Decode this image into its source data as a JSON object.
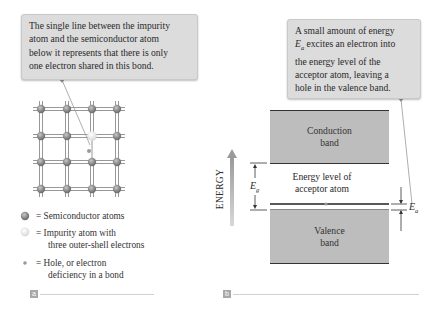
{
  "panel_a": {
    "label": "a",
    "callout": {
      "lines": [
        "The single line between the impurity",
        "atom and the semiconductor atom",
        "below it represents that there is only",
        "one electron shared in this bond."
      ]
    },
    "lattice": {
      "rows": 4,
      "cols": 4,
      "impurity_position": {
        "row": 2,
        "col": 3
      },
      "hole": "below impurity atom"
    },
    "legend": [
      {
        "icon": "semiconductor-atom-icon",
        "text_lines": [
          "= Semiconductor atoms"
        ]
      },
      {
        "icon": "impurity-atom-icon",
        "text_lines": [
          "= Impurity atom with",
          "three outer-shell electrons"
        ]
      },
      {
        "icon": "hole-icon",
        "text_lines": [
          "= Hole, or electron",
          "deficiency in a bond"
        ]
      }
    ]
  },
  "panel_b": {
    "label": "b",
    "callout": {
      "line1": "A small amount of energy",
      "line2_symbol": "E",
      "line2_sub": "a",
      "line2_rest": " excites an electron into",
      "line3": "the energy level of the",
      "line4": "acceptor atom, leaving a",
      "line5": "hole in the valence band."
    },
    "axis_label": "ENERGY",
    "conduction_band": {
      "line1": "Conduction",
      "line2": "band"
    },
    "acceptor_level": {
      "line1": "Energy level of",
      "line2": "acceptor atom"
    },
    "valence_band": {
      "line1": "Valence",
      "line2": "band"
    },
    "gap_label": {
      "symbol": "E",
      "sub": "g"
    },
    "acceptor_gap_label": {
      "symbol": "E",
      "sub": "a"
    }
  },
  "colors": {
    "callout_bg": "#dcdcdc",
    "band_fill": "#bdbdbd",
    "atom": "#8a8a8a",
    "impurity": "#ececec",
    "arrow": "#a0a0a0"
  }
}
